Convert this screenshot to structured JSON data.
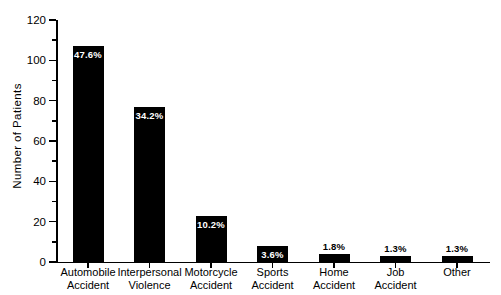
{
  "chart_data": {
    "type": "bar",
    "title": "",
    "subtitle": "",
    "xlabel": "",
    "ylabel": "Number of Patients",
    "ylim": [
      0,
      120
    ],
    "ytick_step": 20,
    "yminor_step": 10,
    "grid": false,
    "legend": null,
    "bar_color": "#000000",
    "background_color": "#ffffff",
    "categories": [
      "Automobile Accident",
      "Interpersonal Violence",
      "Motorcycle Accident",
      "Sports Accident",
      "Home Accident",
      "Job Accident",
      "Other"
    ],
    "category_lines": [
      [
        "Automobile",
        "Accident"
      ],
      [
        "Interpersonal",
        "Violence"
      ],
      [
        "Motorcycle",
        "Accident"
      ],
      [
        "Sports",
        "Accident"
      ],
      [
        "Home",
        "Accident"
      ],
      [
        "Job",
        "Accident"
      ],
      [
        "Other",
        ""
      ]
    ],
    "values": [
      107,
      77,
      23,
      8,
      4,
      3,
      3
    ],
    "data_labels": [
      "47.6%",
      "34.2%",
      "10.2%",
      "3.6%",
      "1.8%",
      "1.3%",
      "1.3%"
    ],
    "label_placement": [
      "inside",
      "inside",
      "inside",
      "inside",
      "above",
      "above",
      "above"
    ],
    "ytick_labels": [
      "0",
      "20",
      "40",
      "60",
      "80",
      "100",
      "120"
    ],
    "ytick_values": [
      0,
      20,
      40,
      60,
      80,
      100,
      120
    ]
  },
  "axis": {
    "y_title": "Number of Patients"
  }
}
